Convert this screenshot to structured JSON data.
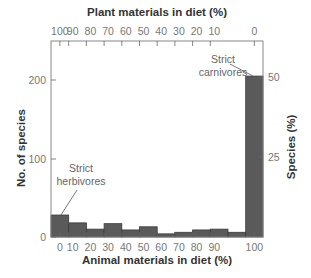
{
  "chart_data": {
    "type": "bar",
    "title": "",
    "top_axis": {
      "label": "Plant materials in diet (%)",
      "ticks": [
        "100",
        "90",
        "80",
        "70",
        "60",
        "50",
        "40",
        "30",
        "20",
        "10",
        "0"
      ]
    },
    "xlabel": "Animal materials in diet (%)",
    "x_ticks": [
      "0",
      "10",
      "20",
      "30",
      "40",
      "50",
      "60",
      "70",
      "80",
      "90",
      "100"
    ],
    "ylabel": "No. of species",
    "y_ticks": [
      "0",
      "100",
      "200"
    ],
    "ylim": [
      0,
      250
    ],
    "y2label": "Species (%)",
    "y2_ticks": [
      "25",
      "50"
    ],
    "categories": [
      "0",
      "1-10",
      "11-20",
      "21-30",
      "31-40",
      "41-50",
      "51-60",
      "61-70",
      "71-80",
      "81-90",
      "91-99",
      "100"
    ],
    "values": [
      28,
      18,
      10,
      17,
      9,
      13,
      4,
      6,
      9,
      10,
      6,
      205
    ],
    "bar_color": "#5a5a5a",
    "annotations": [
      {
        "text_line1": "Strict",
        "text_line2": "herbivores",
        "points_to": "0"
      },
      {
        "text_line1": "Strict",
        "text_line2": "carnivores",
        "points_to": "100"
      }
    ],
    "grid": false,
    "legend": "none"
  },
  "labels": {
    "top": "Plant materials in diet (%)",
    "bottom": "Animal materials in diet (%)",
    "left": "No. of species",
    "right": "Species (%)",
    "herb1": "Strict",
    "herb2": "herbivores",
    "carn1": "Strict",
    "carn2": "carnivores"
  }
}
